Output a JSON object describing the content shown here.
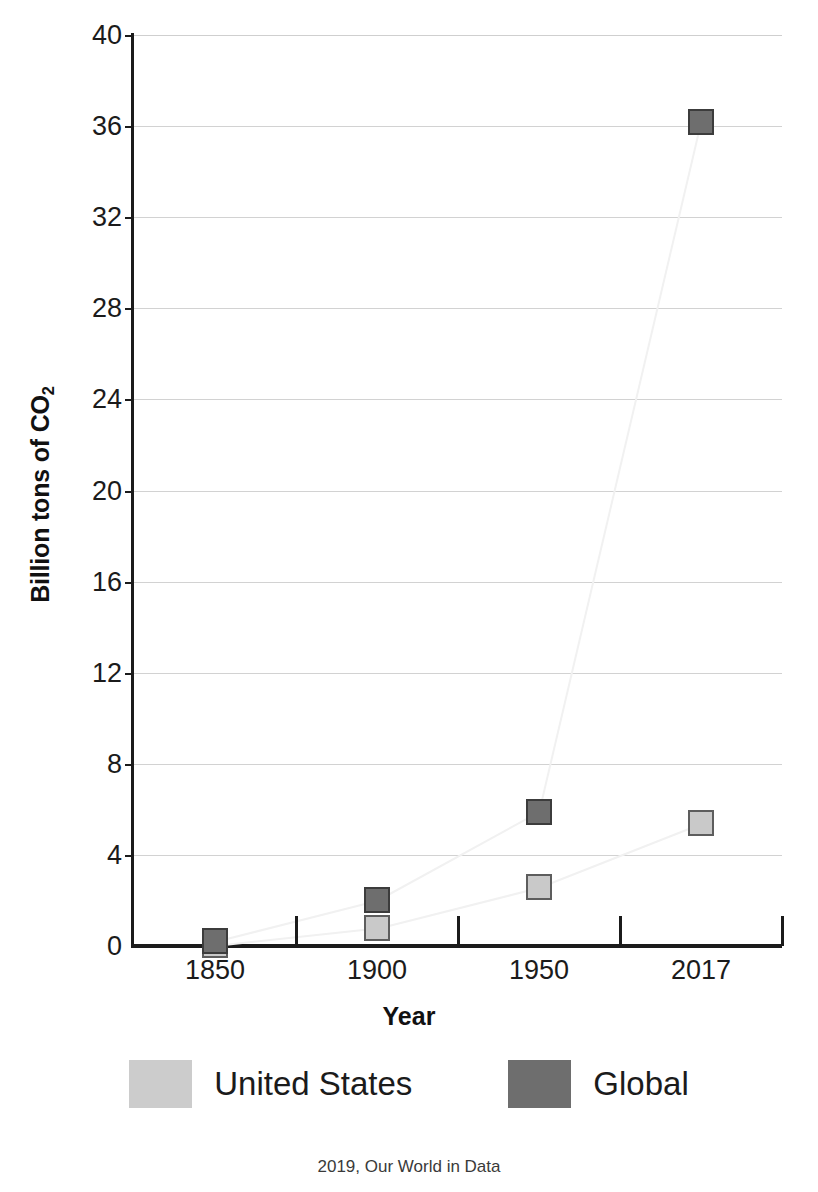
{
  "chart_data": {
    "type": "scatter",
    "title": "",
    "xlabel": "Year",
    "ylabel_text": "Billion tons of CO",
    "ylabel_sub": "2",
    "categories": [
      "1850",
      "1900",
      "1950",
      "2017"
    ],
    "ylim": [
      0,
      40
    ],
    "yticks": [
      "0",
      "4",
      "8",
      "12",
      "16",
      "20",
      "24",
      "28",
      "32",
      "36",
      "40"
    ],
    "grid": true,
    "legend_position": "bottom",
    "series": [
      {
        "name": "United States",
        "color": "#c9c9c9",
        "values": [
          0.03,
          0.8,
          2.6,
          5.4
        ]
      },
      {
        "name": "Global",
        "color": "#6e6e6e",
        "values": [
          0.2,
          2.0,
          5.9,
          36.2
        ]
      }
    ]
  },
  "legend": {
    "items": [
      {
        "label": "United States",
        "key": "us"
      },
      {
        "label": "Global",
        "key": "global"
      }
    ]
  },
  "footer": {
    "credit": "2019, Our World in Data"
  }
}
